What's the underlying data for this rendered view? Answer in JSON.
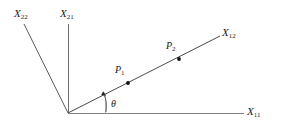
{
  "figure": {
    "title": "",
    "background_color": "#ffffff",
    "line_color": "#555555",
    "accent_color": "#1a1a1a",
    "arc_color": "#9a9a9a",
    "origin": {
      "x": 68,
      "y": 113
    },
    "axes": [
      {
        "name": "x11-axis",
        "label": "X",
        "subscript": "11",
        "label_x": 247,
        "label_y": 106,
        "from": {
          "x": 68,
          "y": 113
        },
        "to": {
          "x": 244,
          "y": 113
        }
      },
      {
        "name": "x21-axis",
        "label": "X",
        "subscript": "21",
        "label_x": 60,
        "label_y": 8,
        "from": {
          "x": 68,
          "y": 113
        },
        "to": {
          "x": 68,
          "y": 24
        }
      },
      {
        "name": "x22-axis",
        "label": "X",
        "subscript": "22",
        "label_x": 14,
        "label_y": 8,
        "from": {
          "x": 68,
          "y": 113
        },
        "to": {
          "x": 24,
          "y": 24
        }
      },
      {
        "name": "x12-axis",
        "label": "X",
        "subscript": "12",
        "label_x": 222,
        "label_y": 27,
        "from": {
          "x": 68,
          "y": 113
        },
        "to": {
          "x": 220,
          "y": 36
        }
      }
    ],
    "points": [
      {
        "name": "point-p1",
        "label": "P",
        "subscript": "1",
        "dot_x": 128,
        "dot_y": 83,
        "label_x": 115,
        "label_y": 65
      },
      {
        "name": "point-p2",
        "label": "P",
        "subscript": "2",
        "dot_x": 179,
        "dot_y": 59,
        "label_x": 166,
        "label_y": 41
      }
    ],
    "angle": {
      "name": "theta-angle",
      "symbol": "θ",
      "label_x": 113,
      "label_y": 100,
      "vertex": {
        "x": 68,
        "y": 113
      },
      "guide_line": {
        "x": 105,
        "y": 113,
        "y_top": 94
      },
      "arc_path": "M 105 110 Q 106 100 103 92"
    }
  }
}
